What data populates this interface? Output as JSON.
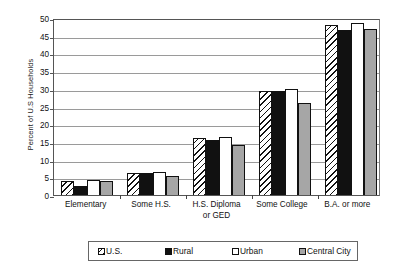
{
  "chart_data": {
    "type": "bar",
    "title": "",
    "xlabel": "",
    "ylabel": "Percent of U.S Households",
    "ylim": [
      0,
      50
    ],
    "ytick_step": 5,
    "yticks": [
      "50",
      "45",
      "40",
      "35",
      "30",
      "25",
      "20",
      "15",
      "10",
      "5",
      "0"
    ],
    "grid": true,
    "legend_position": "bottom",
    "categories": [
      "Elementary",
      "Some H.S.",
      "H.S. Diploma or GED",
      "Some College",
      "B.A. or more"
    ],
    "category_lines": [
      [
        "Elementary"
      ],
      [
        "Some H.S."
      ],
      [
        "H.S. Diploma",
        "or GED"
      ],
      [
        "Some College"
      ],
      [
        "B.A. or more"
      ]
    ],
    "series": [
      {
        "name": "U.S.",
        "fill": "hatch-diagonal",
        "color": "#ffffff",
        "values": [
          4.0,
          6.3,
          16.0,
          29.5,
          48.0
        ]
      },
      {
        "name": "Rural",
        "fill": "solid",
        "color": "#111111",
        "values": [
          2.5,
          6.2,
          15.5,
          29.5,
          46.5
        ]
      },
      {
        "name": "Urban",
        "fill": "solid",
        "color": "#ffffff",
        "values": [
          4.2,
          6.4,
          16.3,
          30.0,
          48.5
        ]
      },
      {
        "name": "Central City",
        "fill": "solid",
        "color": "#a6a6a6",
        "values": [
          4.0,
          5.5,
          14.0,
          26.0,
          47.0
        ]
      }
    ]
  }
}
